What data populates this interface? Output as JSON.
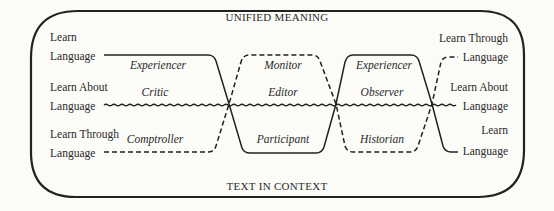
{
  "diagram": {
    "top_label": "UNIFIED MEANING",
    "bottom_label": "TEXT IN CONTEXT",
    "left_labels": [
      {
        "line1": "Learn",
        "line2": "Language"
      },
      {
        "line1": "Learn About",
        "line2": "Language"
      },
      {
        "line1": "Learn Through",
        "line2": "Language"
      }
    ],
    "right_labels": [
      {
        "line1": "Learn Through",
        "line2": "Language"
      },
      {
        "line1": "Learn About",
        "line2": "Language"
      },
      {
        "line1": "Learn",
        "line2": "Language"
      }
    ],
    "segments": [
      {
        "name": "segment-1",
        "roles": {
          "top": "Experiencer",
          "middle": "Critic",
          "bottom": "Comptroller"
        }
      },
      {
        "name": "segment-2",
        "roles": {
          "top": "Monitor",
          "middle": "Editor",
          "bottom": "Participant"
        }
      },
      {
        "name": "segment-3",
        "roles": {
          "top": "Experiencer",
          "middle": "Observer",
          "bottom": "Historian"
        }
      }
    ],
    "line_styles": {
      "learn_language": "solid",
      "learn_about_language": "wavy",
      "learn_through_language": "dashed"
    },
    "colors": {
      "background": "#fbfbf8",
      "ink": "#222222"
    }
  }
}
